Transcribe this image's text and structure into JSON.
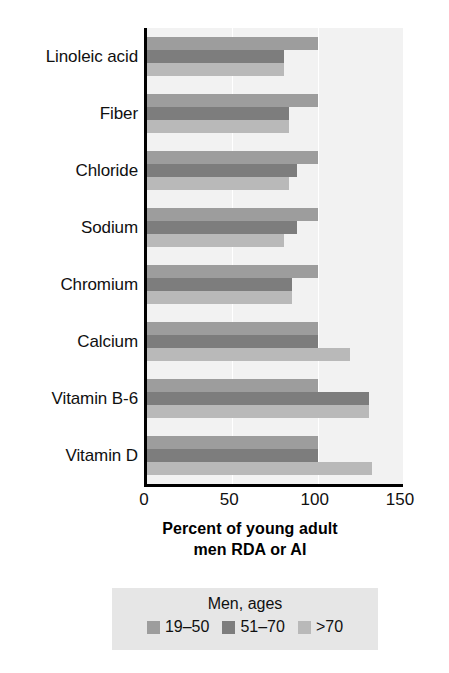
{
  "chart_data": {
    "type": "bar",
    "orientation": "horizontal",
    "title": "",
    "xlabel": "Percent of young adult men RDA or AI",
    "ylabel": "",
    "xlim": [
      0,
      150
    ],
    "xticks": [
      0,
      50,
      100,
      150
    ],
    "xtick_labels": [
      "0",
      "50",
      "100",
      "150"
    ],
    "grid": true,
    "grid_axis": "x",
    "legend_position": "bottom",
    "legend_title": "Men, ages",
    "categories": [
      "Linoleic acid",
      "Fiber",
      "Chloride",
      "Sodium",
      "Chromium",
      "Calcium",
      "Vitamin B-6",
      "Vitamin D"
    ],
    "series": [
      {
        "name": "19–50",
        "color": "#9d9d9d",
        "values": [
          100,
          100,
          100,
          100,
          100,
          100,
          100,
          100
        ]
      },
      {
        "name": "51–70",
        "color": "#7d7d7d",
        "values": [
          80,
          83,
          88,
          88,
          85,
          100,
          130,
          100
        ]
      },
      {
        "name": ">70",
        "color": "#b9b9b9",
        "values": [
          80,
          83,
          83,
          80,
          85,
          119,
          130,
          132
        ]
      }
    ]
  },
  "axis_title": {
    "line1": "Percent of young adult",
    "line2": "men RDA or AI"
  },
  "legend": {
    "title": "Men, ages",
    "items": [
      {
        "label": "19–50",
        "color": "#9d9d9d"
      },
      {
        "label": "51–70",
        "color": "#7d7d7d"
      },
      {
        "label": ">70",
        "color": "#b9b9b9"
      }
    ]
  },
  "colors": {
    "plot_background": "#f2f2f2",
    "gridline": "#ffffff",
    "axis": "#000000",
    "legend_background": "#e6e6e6",
    "text": "#101010"
  }
}
